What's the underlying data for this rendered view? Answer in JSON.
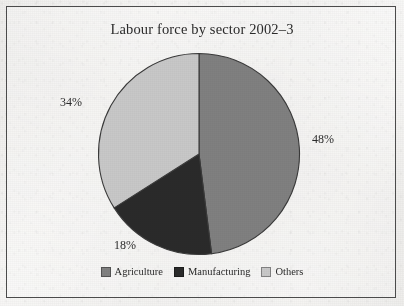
{
  "figure": {
    "title": "Labour force by sector 2002–3",
    "frame": {
      "visible": true,
      "border_color": "#4c4c4c"
    },
    "background_color": "#f3f2f0"
  },
  "chart_data": {
    "type": "pie",
    "title": "Labour force by sector 2002–3",
    "xlabel": "",
    "ylabel": "",
    "categories": [
      "Agriculture",
      "Manufacturing",
      "Others"
    ],
    "values": [
      48,
      18,
      34
    ],
    "value_labels": [
      "48%",
      "18%",
      "34%"
    ],
    "units": "percent",
    "start_angle_deg": 0,
    "direction": "clockwise",
    "colors": [
      "#808080",
      "#2a2a2a",
      "#c8c8c8"
    ],
    "legend_position": "bottom",
    "grid": false,
    "slices": [
      {
        "label": "Agriculture",
        "value": 48,
        "display": "48%",
        "color": "#808080",
        "start_deg": 0.0,
        "end_deg": 172.8
      },
      {
        "label": "Manufacturing",
        "value": 18,
        "display": "18%",
        "color": "#2a2a2a",
        "start_deg": 172.8,
        "end_deg": 237.6
      },
      {
        "label": "Others",
        "value": 34,
        "display": "34%",
        "color": "#c8c8c8",
        "start_deg": 237.6,
        "end_deg": 360.0
      }
    ]
  },
  "labels": {
    "agriculture_pct": "48%",
    "manufacturing_pct": "18%",
    "others_pct": "34%"
  },
  "legend": {
    "items": [
      {
        "label": "Agriculture",
        "color": "#808080"
      },
      {
        "label": "Manufacturing",
        "color": "#2a2a2a"
      },
      {
        "label": "Others",
        "color": "#c8c8c8"
      }
    ]
  }
}
